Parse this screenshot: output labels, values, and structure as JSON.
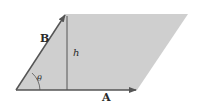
{
  "diagram": {
    "labels": {
      "vector_a": "A",
      "vector_b": "B",
      "height": "h",
      "angle": "θ"
    },
    "colors": {
      "fill": "#cfcfcf",
      "line": "#555555",
      "text": "#2a2a2a"
    }
  }
}
